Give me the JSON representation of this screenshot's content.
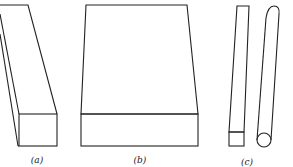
{
  "figures": [
    {
      "id": "a",
      "label": "(a)",
      "description": "rectangular bar with square cross-section, leaning"
    },
    {
      "id": "b",
      "label": "(b)",
      "description": "wide flat slab in perspective"
    },
    {
      "id": "c",
      "label": "(c)",
      "description": "thin square rod and cylindrical rod"
    }
  ],
  "colors": {
    "line": "#222222",
    "background": "#ffffff"
  }
}
